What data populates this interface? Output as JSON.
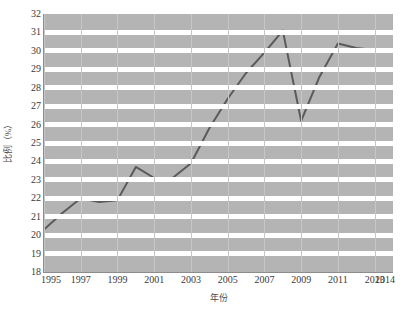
{
  "chart_data": {
    "type": "line",
    "title": "",
    "xlabel": "年份",
    "ylabel": "比例（%）",
    "xlim": [
      1995,
      2014
    ],
    "ylim": [
      18,
      32
    ],
    "grid": true,
    "legend": "none",
    "line_color": "#5a5a5a",
    "plot_background": "#b4b4b4",
    "band_color": "#ffffff",
    "vertical_gridline_color": "#c6c6c6",
    "x_tick_labels": [
      "1995",
      "1997",
      "1999",
      "2001",
      "2003",
      "2005",
      "2007",
      "2009",
      "2011",
      "2013",
      "2014"
    ],
    "x_ticks": [
      1995,
      1997,
      1999,
      2001,
      2003,
      2005,
      2007,
      2009,
      2011,
      2013,
      2014
    ],
    "y_tick_labels": [
      "32",
      "31",
      "30",
      "29",
      "28",
      "27",
      "26",
      "25",
      "24",
      "23",
      "22",
      "21",
      "20",
      "19",
      "18"
    ],
    "y_ticks": [
      32,
      31,
      30,
      29,
      28,
      27,
      26,
      25,
      24,
      23,
      22,
      21,
      20,
      19,
      18
    ],
    "x": [
      1995,
      1996,
      1997,
      1998,
      1999,
      2000,
      2001,
      2002,
      2003,
      2004,
      2005,
      2006,
      2007,
      2008,
      2009,
      2010,
      2011,
      2012,
      2013,
      2013.5
    ],
    "values": [
      20.3,
      21.2,
      22.0,
      21.8,
      21.9,
      23.7,
      23.1,
      23.1,
      23.9,
      25.8,
      27.4,
      28.8,
      29.9,
      31.1,
      26.2,
      28.6,
      30.4,
      30.15,
      30.05,
      29.95
    ],
    "series": [
      {
        "name": "比例（%）",
        "values": [
          20.3,
          21.2,
          22.0,
          21.8,
          21.9,
          23.7,
          23.1,
          23.1,
          23.9,
          25.8,
          27.4,
          28.8,
          29.9,
          31.1,
          26.2,
          28.6,
          30.4,
          30.15,
          30.05,
          29.95
        ]
      }
    ]
  },
  "axes": {
    "y_title": "比例（%）",
    "x_title": "年份"
  }
}
